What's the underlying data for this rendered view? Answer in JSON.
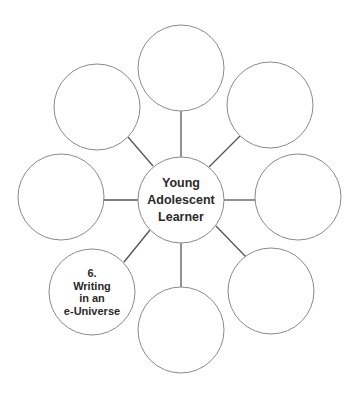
{
  "diagram": {
    "type": "spider-web",
    "center": {
      "lines": [
        "Young",
        "Adolescent",
        "Learner"
      ],
      "cx": 181,
      "cy": 200,
      "r": 43
    },
    "nodes": [
      {
        "id": "top",
        "cx": 181,
        "cy": 68,
        "r": 43,
        "lines": []
      },
      {
        "id": "upper-right",
        "cx": 270,
        "cy": 105,
        "r": 43,
        "lines": []
      },
      {
        "id": "right",
        "cx": 298,
        "cy": 197,
        "r": 43,
        "lines": []
      },
      {
        "id": "lower-right",
        "cx": 271,
        "cy": 291,
        "r": 43,
        "lines": []
      },
      {
        "id": "bottom",
        "cx": 181,
        "cy": 330,
        "r": 43,
        "lines": []
      },
      {
        "id": "lower-left",
        "cx": 92,
        "cy": 292,
        "r": 43,
        "lines": [
          "6.",
          "Writing",
          "in an",
          "e-Universe"
        ]
      },
      {
        "id": "left",
        "cx": 61,
        "cy": 197,
        "r": 43,
        "lines": []
      },
      {
        "id": "upper-left",
        "cx": 97,
        "cy": 107,
        "r": 43,
        "lines": []
      }
    ],
    "colors": {
      "stroke": "#8a8a8a",
      "spoke": "#555555",
      "text": "#2a2a2a",
      "background": "#ffffff"
    }
  }
}
